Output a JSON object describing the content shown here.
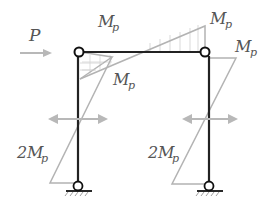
{
  "diagram": {
    "type": "portal-frame-plastic-moment-diagram",
    "load": {
      "label": "P",
      "direction": "right"
    },
    "labels": {
      "beam_left_top": {
        "main": "M",
        "sub": "p"
      },
      "beam_right_top": {
        "main": "M",
        "sub": "p"
      },
      "right_column_top": {
        "main": "M",
        "sub": "p"
      },
      "left_corner_inner": {
        "main": "M",
        "sub": "p"
      },
      "left_column_base": {
        "coef": "2",
        "main": "M",
        "sub": "p"
      },
      "right_column_base": {
        "coef": "2",
        "main": "M",
        "sub": "p"
      }
    },
    "supports": [
      "pin-left-base",
      "pin-right-base"
    ],
    "hinges": [
      "left-top-corner",
      "right-top-corner"
    ],
    "colors": {
      "frame": "#222222",
      "moment_diagram": "#b0b0b0",
      "load_arrow": "#b8b8b8",
      "text": "#555555"
    }
  }
}
